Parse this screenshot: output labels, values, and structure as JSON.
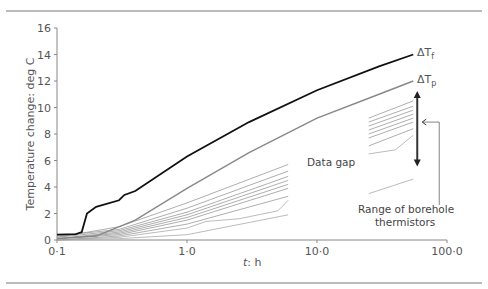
{
  "chart_data": {
    "type": "line",
    "title": "",
    "xlabel": "t: h",
    "ylabel": "Temperature change: deg C",
    "xscale": "log",
    "xlim": [
      0.1,
      100
    ],
    "ylim": [
      0,
      16
    ],
    "xticks": [
      "0·1",
      "1·0",
      "10·0",
      "100·0"
    ],
    "yticks": [
      "0",
      "2",
      "4",
      "6",
      "8",
      "10",
      "12",
      "14",
      "16"
    ],
    "grid": false,
    "series": [
      {
        "name": "ΔTf",
        "color": "#111111",
        "width": 1.8,
        "x": [
          0.1,
          0.14,
          0.155,
          0.17,
          0.2,
          0.3,
          0.33,
          0.4,
          1.0,
          3.0,
          10,
          30,
          55
        ],
        "y": [
          0.4,
          0.45,
          0.6,
          2.0,
          2.5,
          3.0,
          3.4,
          3.7,
          6.3,
          8.9,
          11.3,
          13.1,
          14.0
        ]
      },
      {
        "name": "ΔTp",
        "color": "#888888",
        "width": 1.4,
        "x": [
          0.1,
          0.2,
          0.4,
          1.0,
          3.0,
          10,
          30,
          55
        ],
        "y": [
          0.1,
          0.3,
          1.5,
          3.9,
          6.6,
          9.2,
          11.0,
          12.0
        ]
      },
      {
        "name": "borehole-1",
        "color": "#999999",
        "width": 0.8,
        "x": [
          0.1,
          0.3,
          1.0,
          6,
          25,
          55
        ],
        "y": [
          0.2,
          1.0,
          2.8,
          5.7,
          9.2,
          10.5
        ]
      },
      {
        "name": "borehole-2",
        "color": "#999999",
        "width": 0.8,
        "x": [
          0.1,
          0.3,
          1.0,
          6,
          25,
          55
        ],
        "y": [
          0.3,
          0.8,
          2.4,
          5.2,
          8.9,
          10.1
        ]
      },
      {
        "name": "borehole-3",
        "color": "#999999",
        "width": 0.8,
        "x": [
          0.1,
          0.3,
          1.0,
          6,
          25,
          55
        ],
        "y": [
          0.2,
          0.7,
          2.1,
          4.8,
          8.6,
          9.8
        ]
      },
      {
        "name": "borehole-4",
        "color": "#999999",
        "width": 0.8,
        "x": [
          0.1,
          0.3,
          1.0,
          6,
          25,
          55
        ],
        "y": [
          0.1,
          0.6,
          1.9,
          4.5,
          8.3,
          9.5
        ]
      },
      {
        "name": "borehole-5",
        "color": "#999999",
        "width": 0.8,
        "x": [
          0.1,
          0.3,
          1.0,
          6,
          25,
          55
        ],
        "y": [
          0.1,
          0.5,
          1.7,
          4.2,
          8.0,
          9.2
        ]
      },
      {
        "name": "borehole-6",
        "color": "#999999",
        "width": 0.8,
        "x": [
          0.1,
          0.3,
          1.0,
          6,
          25,
          55
        ],
        "y": [
          0.1,
          0.4,
          1.5,
          3.9,
          7.7,
          8.9
        ]
      },
      {
        "name": "borehole-7",
        "color": "#999999",
        "width": 0.8,
        "x": [
          0.1,
          0.3,
          1.0,
          6,
          25,
          55
        ],
        "y": [
          0.0,
          0.3,
          1.2,
          3.3,
          7.1,
          8.4
        ]
      },
      {
        "name": "borehole-8",
        "color": "#aaaaaa",
        "width": 0.8,
        "x": [
          0.1,
          0.3,
          1.0,
          1.4,
          2.5,
          5,
          6,
          25,
          40,
          55
        ],
        "y": [
          0.0,
          0.2,
          0.9,
          1.4,
          1.6,
          2.2,
          3.0,
          6.5,
          6.8,
          7.9
        ]
      },
      {
        "name": "borehole-9",
        "color": "#aaaaaa",
        "width": 0.8,
        "x": [
          0.1,
          0.3,
          1.0,
          6,
          25,
          55
        ],
        "y": [
          0.0,
          0.1,
          0.4,
          1.9,
          3.5,
          4.6
        ]
      }
    ],
    "annotations": [
      {
        "text": "ΔTf",
        "x": 60,
        "y": 14.2
      },
      {
        "text": "ΔTp",
        "x": 60,
        "y": 12.2
      },
      {
        "text": "Data gap",
        "x": 10,
        "y": 6.4
      },
      {
        "text": "Range of borehole thermistors",
        "x": 45,
        "y": 3.0
      }
    ],
    "data_gap": [
      6,
      25
    ],
    "range_arrow": {
      "x": 55,
      "y_from": 11.1,
      "y_to": 5.7
    }
  },
  "labels": {
    "dTf_main": "ΔT",
    "dTf_sub": "f",
    "dTp_main": "ΔT",
    "dTp_sub": "p",
    "data_gap": "Data gap",
    "range_line1": "Range of borehole",
    "range_line2": "thermistors",
    "xlabel_t": "t",
    "xlabel_unit": ": h",
    "ylabel": "Temperature change: deg C"
  }
}
